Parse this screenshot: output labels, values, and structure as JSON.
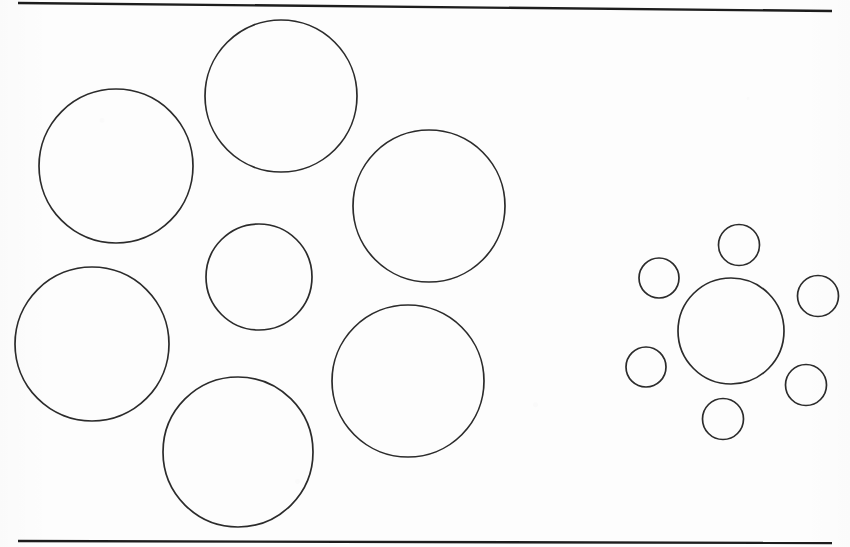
{
  "figure": {
    "kind": "ebbinghaus-titchener-circles-illusion",
    "background_color": "#fdfdfd",
    "stroke_color": "#2b2b2b",
    "fill_color": "none",
    "canvas": {
      "width": 850,
      "height": 547
    },
    "rules": [
      {
        "name": "top-rule",
        "x1": 18,
        "y1": 3,
        "x2": 832,
        "y2": 11,
        "stroke_width": 2.4,
        "color": "#1d1d1d"
      },
      {
        "name": "bottom-rule",
        "x1": 18,
        "y1": 541,
        "x2": 832,
        "y2": 543,
        "stroke_width": 2.4,
        "color": "#1d1d1d"
      }
    ],
    "clusters": [
      {
        "name": "left-cluster",
        "label": "small center surrounded by large circles",
        "center_circle": {
          "name": "left-center-circle",
          "cx": 259,
          "cy": 277,
          "r": 53,
          "stroke_width": 1.7
        },
        "surrounding_circles": [
          {
            "name": "left-surround-circle-1",
            "cx": 116,
            "cy": 166,
            "r": 77,
            "stroke_width": 1.7
          },
          {
            "name": "left-surround-circle-2",
            "cx": 281,
            "cy": 96,
            "r": 76,
            "stroke_width": 1.7
          },
          {
            "name": "left-surround-circle-3",
            "cx": 429,
            "cy": 206,
            "r": 76,
            "stroke_width": 1.7
          },
          {
            "name": "left-surround-circle-4",
            "cx": 92,
            "cy": 344,
            "r": 77,
            "stroke_width": 1.7
          },
          {
            "name": "left-surround-circle-5",
            "cx": 408,
            "cy": 381,
            "r": 76,
            "stroke_width": 1.7
          },
          {
            "name": "left-surround-circle-6",
            "cx": 238,
            "cy": 452,
            "r": 75,
            "stroke_width": 1.7
          }
        ]
      },
      {
        "name": "right-cluster",
        "label": "large center surrounded by small circles",
        "center_circle": {
          "name": "right-center-circle",
          "cx": 731,
          "cy": 331,
          "r": 53,
          "stroke_width": 1.7
        },
        "surrounding_circles": [
          {
            "name": "right-surround-circle-1",
            "cx": 739,
            "cy": 245,
            "r": 20.5,
            "stroke_width": 1.7
          },
          {
            "name": "right-surround-circle-2",
            "cx": 659,
            "cy": 278,
            "r": 20.0,
            "stroke_width": 1.7
          },
          {
            "name": "right-surround-circle-3",
            "cx": 818,
            "cy": 296,
            "r": 20.5,
            "stroke_width": 1.7
          },
          {
            "name": "right-surround-circle-4",
            "cx": 646,
            "cy": 367,
            "r": 20.0,
            "stroke_width": 1.7
          },
          {
            "name": "right-surround-circle-5",
            "cx": 806,
            "cy": 385,
            "r": 20.5,
            "stroke_width": 1.7
          },
          {
            "name": "right-surround-circle-6",
            "cx": 723,
            "cy": 419,
            "r": 20.5,
            "stroke_width": 1.7
          }
        ]
      }
    ]
  }
}
